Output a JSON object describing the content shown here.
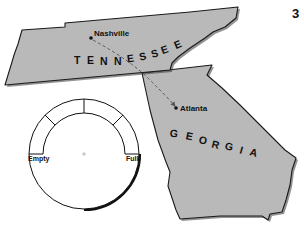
{
  "figure": {
    "number": "3",
    "background": "#ffffff",
    "state_fill": "#b9b9b9",
    "outline": "#1a1a1a"
  },
  "states": [
    {
      "name": "TENNESSEE",
      "letters": [
        "T",
        "E",
        "N",
        "N",
        "E",
        "S",
        "S",
        "E",
        "E"
      ]
    },
    {
      "name": "GEORGIA",
      "letters": [
        "G",
        "E",
        "O",
        "R",
        "G",
        "I",
        "A"
      ]
    }
  ],
  "cities": [
    {
      "name": "Nashville",
      "x": 91,
      "y": 38
    },
    {
      "name": "Atlanta",
      "x": 176,
      "y": 108
    }
  ],
  "route": {
    "from": "Nashville",
    "to": "Atlanta",
    "style": "dashed-arrow"
  },
  "gauge": {
    "type": "fuel-gauge",
    "left_label": "Empty",
    "right_label": "Full",
    "segments": 4
  }
}
